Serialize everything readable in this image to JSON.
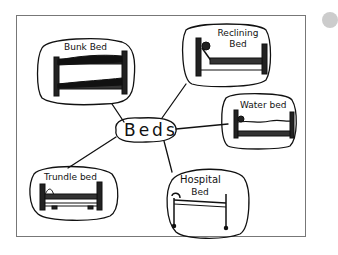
{
  "diagram": {
    "type": "mind-map",
    "style": "hand-drawn",
    "center": {
      "label": "Beds"
    },
    "nodes": [
      {
        "id": "bunk",
        "label": "Bunk Bed"
      },
      {
        "id": "reclining",
        "label_line1": "Reclining",
        "label_line2": "Bed"
      },
      {
        "id": "water",
        "label": "Water bed"
      },
      {
        "id": "trundle",
        "label": "Trundle bed"
      },
      {
        "id": "hospital",
        "label_line1": "Hospital",
        "label_line2": "Bed"
      }
    ],
    "edges": [
      [
        "Beds",
        "Bunk Bed"
      ],
      [
        "Beds",
        "Reclining Bed"
      ],
      [
        "Beds",
        "Water bed"
      ],
      [
        "Beds",
        "Trundle bed"
      ],
      [
        "Beds",
        "Hospital Bed"
      ]
    ]
  }
}
